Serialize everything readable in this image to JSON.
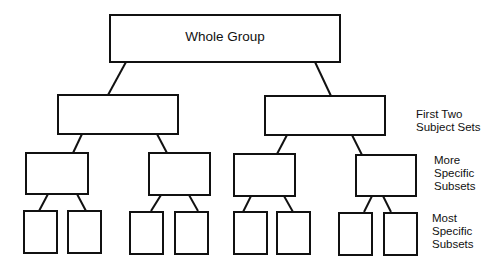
{
  "diagram": {
    "type": "hierarchy-tree",
    "root": {
      "label": "Whole Group"
    },
    "levels": [
      {
        "label": "First Two Subject Sets",
        "lines": [
          "First Two",
          "Subject Sets"
        ],
        "box_count": 2
      },
      {
        "label": "More Specific Subsets",
        "lines": [
          "More",
          "Specific",
          "Subsets"
        ],
        "box_count": 4
      },
      {
        "label": "Most Specific Subsets",
        "lines": [
          "Most",
          "Specific",
          "Subsets"
        ],
        "box_count": 8
      }
    ],
    "colors": {
      "stroke": "#111111",
      "background": "#ffffff"
    }
  }
}
